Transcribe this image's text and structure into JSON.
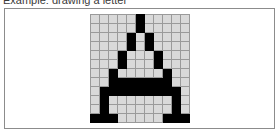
{
  "caption": {
    "text": "Example: drawing a letter"
  },
  "panel": {
    "name": "pixel-grid-panel",
    "border_color": "#8c8c8c",
    "background_color": "#ffffff"
  },
  "grid": {
    "columns": 11,
    "rows": 12,
    "cell_size_px": 8,
    "on_color": "#000000",
    "off_color": "#d9d9d9",
    "gridline_color": "#9a9a9a",
    "border_color": "#6e6e6e",
    "depicted_glyph": "A",
    "cells": [
      [
        0,
        0,
        0,
        0,
        0,
        1,
        0,
        0,
        0,
        0,
        0
      ],
      [
        0,
        0,
        0,
        0,
        0,
        1,
        0,
        0,
        0,
        0,
        0
      ],
      [
        0,
        0,
        0,
        0,
        1,
        0,
        1,
        0,
        0,
        0,
        0
      ],
      [
        0,
        0,
        0,
        0,
        1,
        0,
        1,
        0,
        0,
        0,
        0
      ],
      [
        0,
        0,
        0,
        1,
        0,
        0,
        0,
        1,
        0,
        0,
        0
      ],
      [
        0,
        0,
        0,
        1,
        0,
        0,
        0,
        1,
        0,
        0,
        0
      ],
      [
        0,
        0,
        1,
        0,
        0,
        0,
        0,
        0,
        1,
        0,
        0
      ],
      [
        0,
        0,
        1,
        1,
        1,
        1,
        1,
        1,
        1,
        0,
        0
      ],
      [
        0,
        1,
        1,
        1,
        1,
        1,
        1,
        1,
        1,
        1,
        0
      ],
      [
        0,
        1,
        0,
        0,
        0,
        0,
        0,
        0,
        0,
        1,
        0
      ],
      [
        0,
        1,
        0,
        0,
        0,
        0,
        0,
        0,
        0,
        1,
        0
      ],
      [
        1,
        1,
        1,
        0,
        0,
        0,
        0,
        0,
        1,
        1,
        1
      ]
    ]
  }
}
